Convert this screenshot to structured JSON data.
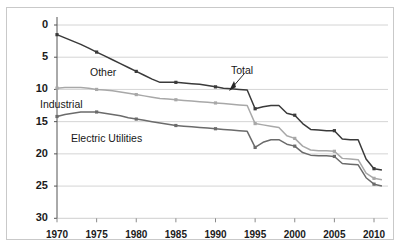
{
  "figure": {
    "top_caption_fragment": "",
    "background_color": "#ffffff",
    "frame_color": "#c9c9c9"
  },
  "chart_data": {
    "type": "line",
    "title": "",
    "subtitle": "",
    "xlabel": "",
    "ylabel": "",
    "xlim": [
      1970,
      2011
    ],
    "ylim": [
      0,
      30
    ],
    "grid": true,
    "grid_axis": "y",
    "legend": "inline-annotations",
    "y_ticks": [
      0,
      5,
      10,
      15,
      20,
      25,
      30
    ],
    "x_ticks": [
      1970,
      1975,
      1980,
      1985,
      1990,
      1995,
      2000,
      2005,
      2010
    ],
    "x": [
      1970,
      1971,
      1972,
      1973,
      1974,
      1975,
      1976,
      1977,
      1978,
      1979,
      1980,
      1981,
      1982,
      1983,
      1984,
      1985,
      1986,
      1987,
      1988,
      1989,
      1990,
      1991,
      1992,
      1993,
      1994,
      1995,
      1996,
      1997,
      1998,
      1999,
      2000,
      2001,
      2002,
      2003,
      2004,
      2005,
      2006,
      2007,
      2008,
      2009,
      2010,
      2011
    ],
    "series": [
      {
        "name": "Total",
        "color": "#3a3a3a",
        "values": [
          28.5,
          28.0,
          27.5,
          27.0,
          26.4,
          25.8,
          25.2,
          24.6,
          24.0,
          23.4,
          22.8,
          22.2,
          21.6,
          21.1,
          21.1,
          21.1,
          21.0,
          20.9,
          20.8,
          20.6,
          20.4,
          20.2,
          20.1,
          20.0,
          19.9,
          17.0,
          17.3,
          17.5,
          17.5,
          16.3,
          16.0,
          14.7,
          13.8,
          13.7,
          13.6,
          13.6,
          12.3,
          12.2,
          12.2,
          9.2,
          7.7,
          7.5
        ]
      },
      {
        "name": "Industrial",
        "color": "#a8a8a8",
        "values": [
          20.2,
          20.3,
          20.3,
          20.3,
          20.2,
          20.0,
          19.9,
          19.8,
          19.6,
          19.4,
          19.2,
          19.0,
          18.8,
          18.6,
          18.5,
          18.4,
          18.3,
          18.2,
          18.1,
          18.0,
          17.9,
          17.8,
          17.7,
          17.6,
          17.5,
          14.7,
          14.5,
          14.3,
          14.1,
          12.8,
          12.4,
          11.2,
          10.6,
          10.5,
          10.5,
          10.4,
          9.3,
          9.2,
          9.1,
          7.0,
          6.2,
          6.0
        ]
      },
      {
        "name": "Electric Utilities",
        "color": "#6b6b6b",
        "values": [
          15.8,
          16.1,
          16.3,
          16.5,
          16.5,
          16.5,
          16.3,
          16.1,
          15.9,
          15.6,
          15.4,
          15.2,
          15.0,
          14.8,
          14.6,
          14.4,
          14.3,
          14.2,
          14.1,
          14.0,
          13.9,
          13.8,
          13.7,
          13.6,
          13.5,
          11.0,
          11.8,
          12.2,
          12.2,
          11.5,
          11.2,
          10.2,
          9.8,
          9.7,
          9.7,
          9.6,
          8.5,
          8.4,
          8.3,
          6.3,
          5.3,
          5.0
        ]
      }
    ],
    "annotations": [
      {
        "text": "Other",
        "kind": "series-label",
        "x_px": 90,
        "y_px": 66
      },
      {
        "text": "Industrial",
        "kind": "series-label",
        "x_px": 40,
        "y_px": 98
      },
      {
        "text": "Electric Utilities",
        "kind": "series-label",
        "x_px": 71,
        "y_px": 132
      },
      {
        "text": "Total",
        "kind": "callout-label",
        "x_px": 231,
        "y_px": 64,
        "arrow": "down-left"
      }
    ]
  },
  "axis": {
    "y_tick_labels": [
      "30",
      "25",
      "20",
      "15",
      "10",
      "5",
      "0"
    ],
    "x_tick_labels": [
      "1970",
      "1975",
      "1980",
      "1985",
      "1990",
      "1995",
      "2000",
      "2005",
      "2010"
    ]
  }
}
